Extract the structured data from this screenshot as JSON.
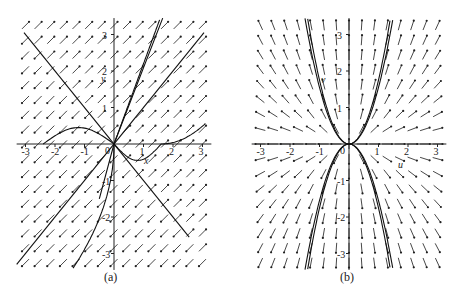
{
  "figure": {
    "caption_a": "(a)",
    "caption_b": "(b)"
  },
  "chart_data": [
    {
      "type": "direction-field",
      "panel": "(a)",
      "xlim": [
        -3,
        3
      ],
      "ylim": [
        -3,
        3
      ],
      "x_ticks": [
        "-3",
        "-2",
        "-1",
        "0",
        "1",
        "2",
        "3"
      ],
      "y_ticks": [
        "-3",
        "-2",
        "-1",
        "1",
        "2",
        "3"
      ],
      "xlabel": "x",
      "ylabel": "y",
      "field": "saddle/improper node phase portrait with straight-line solutions",
      "straight_lines": [
        {
          "slope": -1,
          "label": "y = -x"
        },
        {
          "slope": 1,
          "label": "y = x"
        },
        {
          "slope": 2,
          "label": "y = 2x"
        }
      ],
      "trajectories": "curved trajectories through origin",
      "grid": false
    },
    {
      "type": "direction-field",
      "panel": "(b)",
      "xlim": [
        -3,
        3
      ],
      "ylim": [
        -3,
        3
      ],
      "x_ticks": [
        "-3",
        "-2",
        "-1",
        "0",
        "1",
        "2",
        "3"
      ],
      "y_ticks": [
        "-3",
        "-2",
        "-1",
        "1",
        "2",
        "3"
      ],
      "xlabel": "u",
      "ylabel": "v",
      "field": "symmetric parabolic node, v grows like u^2",
      "trajectories": [
        {
          "label": "v = 2u^2"
        },
        {
          "label": "v = 2.4u^2"
        },
        {
          "label": "v = -2u^2"
        },
        {
          "label": "v = -2.4u^2"
        }
      ],
      "grid": false
    }
  ]
}
